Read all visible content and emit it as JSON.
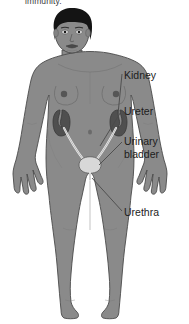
{
  "page": {
    "width": 189,
    "height": 324,
    "background_color": "#ffffff",
    "cut_off_text": "immunity."
  },
  "illustration": {
    "name": "female-urinary-system-diagram",
    "subject": "anterior view of a standing female human body showing the urinary system",
    "colors": {
      "skin": "#8a8a8a",
      "skin_shadow": "#7b7b7b",
      "outline": "#4a4a4a",
      "hair": "#141414",
      "kidney": "#4f4f4f",
      "kidney_outline": "#3a3a3a",
      "ureter": "#efefef",
      "bladder": "#d8d8d8",
      "urethra": "#efefef",
      "nipple": "#5a5a5a",
      "leader_line": "#4a4a4a",
      "label_text": "#1c1c1c"
    },
    "organs": [
      {
        "name": "kidney-left",
        "label": "Kidney"
      },
      {
        "name": "kidney-right",
        "label": "Kidney"
      },
      {
        "name": "ureter-left",
        "label": "Ureter"
      },
      {
        "name": "ureter-right",
        "label": "Ureter"
      },
      {
        "name": "urinary-bladder",
        "label": "Urinary bladder"
      },
      {
        "name": "urethra",
        "label": "Urethra"
      }
    ]
  },
  "labels": [
    {
      "id": "kidney",
      "text": "Kidney",
      "lines": [
        "Kidney"
      ]
    },
    {
      "id": "ureter",
      "text": "Ureter",
      "lines": [
        "Ureter"
      ]
    },
    {
      "id": "bladder",
      "text": "Urinary bladder",
      "lines": [
        "Urinary",
        "bladder"
      ]
    },
    {
      "id": "urethra",
      "text": "Urethra",
      "lines": [
        "Urethra"
      ]
    }
  ],
  "label_text": {
    "kidney": "Kidney",
    "ureter": "Ureter",
    "bladder_line1": "Urinary",
    "bladder_line2": "bladder",
    "urethra": "Urethra"
  }
}
